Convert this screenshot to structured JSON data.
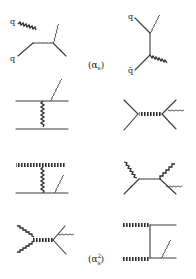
{
  "figure": {
    "order_labels": {
      "first": {
        "open": "(",
        "symbol": "α",
        "sub": "s",
        "close": ")"
      },
      "second": {
        "open": "(",
        "symbol": "α",
        "sub": "s",
        "sup": "2",
        "close": ")"
      }
    },
    "particle_labels": {
      "d1_top": "q",
      "d1_bottom": "q",
      "d2_top": "q",
      "d2_bottom": "q̄"
    },
    "diagrams": [
      {
        "id": "annihilation-s-channel",
        "order": "αs"
      },
      {
        "id": "annihilation-t-channel",
        "order": "αs"
      },
      {
        "id": "t-exchange-gluon-photon-top",
        "order": "αs2"
      },
      {
        "id": "s-channel-gluon-photon",
        "order": "αs2"
      },
      {
        "id": "gluon-line-t-exchange",
        "order": "αs2"
      },
      {
        "id": "gluon-pair-vertex",
        "order": "αs2"
      },
      {
        "id": "triple-gluon-vertex",
        "order": "αs2"
      },
      {
        "id": "gluon-box-exchange",
        "order": "αs2"
      }
    ]
  }
}
